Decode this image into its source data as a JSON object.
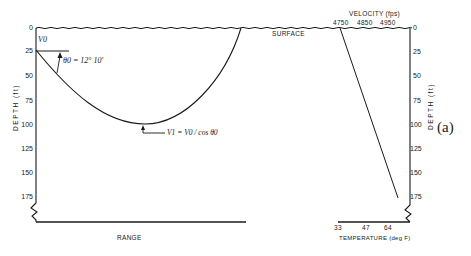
{
  "figure": {
    "panel_label": "(a)",
    "left_axis": {
      "label": "DEPTH (ft)",
      "ticks": [
        "0",
        "25",
        "50",
        "75",
        "100",
        "125",
        "150",
        "175"
      ]
    },
    "right_axis": {
      "label": "DEPTH (ft)",
      "ticks": [
        "0",
        "25",
        "50",
        "75",
        "100",
        "125",
        "150",
        "175"
      ]
    },
    "bottom_left_label": "RANGE",
    "surface_label": "SURFACE",
    "velocity_axis": {
      "title": "VELOCITY (fps)",
      "ticks": [
        "4750",
        "4850",
        "4950"
      ]
    },
    "temperature_axis": {
      "title": "TEMPERATURE (deg F)",
      "ticks": [
        "33",
        "47",
        "64"
      ]
    },
    "annotations": {
      "v0": "V0",
      "theta0": "θ0 = 12° 10′",
      "vertex": "V1 = V0 / cos θ0"
    },
    "colors": {
      "ink": "#1a1a1a",
      "background": "#ffffff"
    }
  }
}
